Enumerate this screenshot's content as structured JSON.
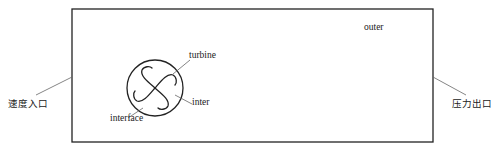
{
  "diagram": {
    "labels": {
      "velocity_inlet": "速度入口",
      "pressure_outlet": "压力出口",
      "outer": "outer",
      "turbine": "turbine",
      "inter": "inter",
      "interface": "interface"
    },
    "colors": {
      "stroke": "#222222",
      "leader": "#666666",
      "background": "#ffffff"
    }
  }
}
